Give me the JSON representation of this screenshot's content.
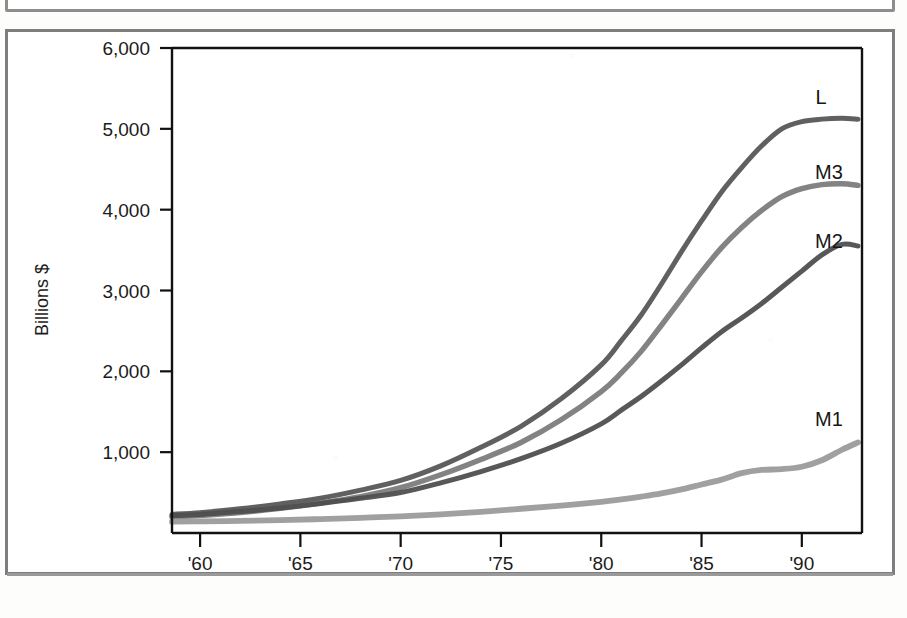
{
  "figure": {
    "kind": "scanned-line-chart",
    "frame_color": "#7e7e7e",
    "background_color": "#ffffff"
  },
  "chart_data": {
    "type": "line",
    "title": "",
    "subtitle": "",
    "xlabel": "",
    "ylabel": "Billions $",
    "xlim": [
      1958.6,
      1993.0
    ],
    "ylim": [
      0,
      6000
    ],
    "grid": false,
    "legend_position": "inline-right-of-series-end",
    "y_ticks": [
      1000,
      2000,
      3000,
      4000,
      5000,
      6000
    ],
    "y_tick_labels": [
      "1,000",
      "2,000",
      "3,000",
      "4,000",
      "5,000",
      "6,000"
    ],
    "x_ticks": [
      1960,
      1965,
      1970,
      1975,
      1980,
      1985,
      1990
    ],
    "x_tick_labels": [
      "'60",
      "'65",
      "'70",
      "'75",
      "'80",
      "'85",
      "'90"
    ],
    "x": [
      1958.6,
      1960,
      1962,
      1964,
      1966,
      1968,
      1970,
      1972,
      1974,
      1976,
      1978,
      1980,
      1981,
      1982,
      1983,
      1984,
      1985,
      1986,
      1987,
      1988,
      1989,
      1990,
      1991,
      1992,
      1992.8
    ],
    "series": [
      {
        "name": "L",
        "label": "L",
        "color": "#565656",
        "stroke_width": 5.0,
        "end_value": 5120,
        "values": [
          230,
          252,
          300,
          360,
          430,
          530,
          650,
          830,
          1060,
          1320,
          1660,
          2080,
          2380,
          2700,
          3080,
          3480,
          3860,
          4220,
          4520,
          4790,
          5000,
          5090,
          5120,
          5130,
          5120
        ]
      },
      {
        "name": "M3",
        "label": "M3",
        "color": "#7b7b7b",
        "stroke_width": 5.4,
        "end_value": 4300,
        "values": [
          200,
          215,
          252,
          305,
          370,
          450,
          560,
          720,
          910,
          1120,
          1400,
          1750,
          1980,
          2250,
          2570,
          2900,
          3230,
          3530,
          3780,
          3990,
          4160,
          4260,
          4310,
          4320,
          4300
        ]
      },
      {
        "name": "M2",
        "label": "M2",
        "color": "#4e4e4e",
        "stroke_width": 5.0,
        "end_value": 3550,
        "values": [
          215,
          230,
          265,
          310,
          365,
          430,
          500,
          620,
          760,
          920,
          1110,
          1350,
          1520,
          1690,
          1880,
          2080,
          2290,
          2490,
          2660,
          2840,
          3040,
          3240,
          3440,
          3570,
          3550
        ]
      },
      {
        "name": "M1",
        "label": "M1",
        "color": "#9a9a9a",
        "stroke_width": 5.8,
        "end_value": 1120,
        "values": [
          140,
          143,
          150,
          160,
          172,
          188,
          205,
          230,
          262,
          300,
          340,
          385,
          415,
          450,
          490,
          540,
          600,
          660,
          740,
          780,
          790,
          820,
          900,
          1030,
          1120
        ]
      }
    ],
    "series_label_positions": [
      {
        "name": "L",
        "x_px": 821,
        "y_px": 104
      },
      {
        "name": "M3",
        "x_px": 829,
        "y_px": 179
      },
      {
        "name": "M2",
        "x_px": 829,
        "y_px": 248
      },
      {
        "name": "M1",
        "x_px": 829,
        "y_px": 426
      }
    ]
  }
}
